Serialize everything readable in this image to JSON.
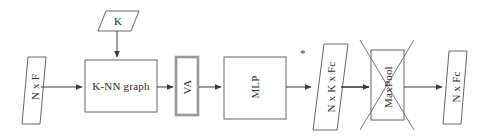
{
  "diagram": {
    "type": "flowchart",
    "canvas": {
      "width": 485,
      "height": 136
    },
    "style": {
      "stroke": "#555555",
      "highlight_stroke": "#8a8a8a",
      "text_color": "#2b2b2b",
      "background": "#ffffff"
    },
    "nodes": [
      {
        "id": "input",
        "label": "N x F",
        "shape": "parallelogram",
        "orientation": "vertical"
      },
      {
        "id": "k",
        "label": "K",
        "shape": "parallelogram",
        "orientation": "horizontal"
      },
      {
        "id": "knn",
        "label": "K-NN graph",
        "shape": "rectangle",
        "orientation": "horizontal"
      },
      {
        "id": "va",
        "label": "VA",
        "shape": "rectangle",
        "orientation": "vertical",
        "emphasis": "thick-border"
      },
      {
        "id": "mlp",
        "label": "MLP",
        "shape": "rectangle",
        "orientation": "vertical"
      },
      {
        "id": "tensor_nkfc",
        "label": "N x K x Fc",
        "shape": "parallelogram",
        "orientation": "vertical"
      },
      {
        "id": "maxpool",
        "label": "MaxPool",
        "shape": "rectangle",
        "orientation": "vertical",
        "emphasis": "crossed-out"
      },
      {
        "id": "output",
        "label": "N x Fc",
        "shape": "parallelogram",
        "orientation": "vertical"
      }
    ],
    "annotations": [
      {
        "id": "asterisk",
        "label": "*"
      }
    ],
    "edges": [
      {
        "from": "input",
        "to": "knn",
        "direction": "right"
      },
      {
        "from": "k",
        "to": "knn",
        "direction": "down"
      },
      {
        "from": "knn",
        "to": "va",
        "direction": "right"
      },
      {
        "from": "va",
        "to": "mlp",
        "direction": "right"
      },
      {
        "from": "mlp",
        "to": "tensor_nkfc",
        "direction": "right"
      },
      {
        "from": "tensor_nkfc",
        "to": "maxpool",
        "direction": "right"
      },
      {
        "from": "maxpool",
        "to": "output",
        "direction": "right"
      }
    ]
  }
}
